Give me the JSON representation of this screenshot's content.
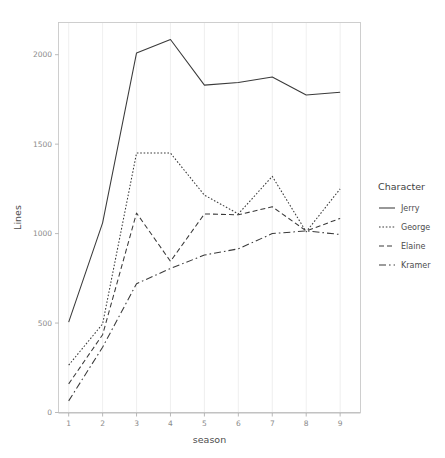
{
  "chart_data": {
    "type": "line",
    "title": "",
    "xlabel": "season",
    "ylabel": "Lines",
    "x": [
      1,
      2,
      3,
      4,
      5,
      6,
      7,
      8,
      9
    ],
    "categories": [
      "1",
      "2",
      "3",
      "4",
      "5",
      "6",
      "7",
      "8",
      "9"
    ],
    "xlim": [
      0.7,
      9.6
    ],
    "ylim": [
      0,
      2180
    ],
    "y_ticks": [
      0,
      500,
      1000,
      1500,
      2000
    ],
    "y_tick_labels": [
      "0",
      "500",
      "1000",
      "1500",
      "2000"
    ],
    "x_ticks": [
      1,
      2,
      3,
      4,
      5,
      6,
      7,
      8,
      9
    ],
    "x_tick_labels": [
      "1",
      "2",
      "3",
      "4",
      "5",
      "6",
      "7",
      "8",
      "9"
    ],
    "grid": "vertical-major-only",
    "legend_position": "right",
    "legend_title": "Character",
    "series": [
      {
        "name": "Jerry",
        "linestyle": "solid",
        "dash_pattern": "none",
        "color": "#3a3a3a",
        "values": [
          505,
          1060,
          2010,
          2085,
          1830,
          1845,
          1875,
          1775,
          1790
        ]
      },
      {
        "name": "George",
        "linestyle": "dotted",
        "dash_pattern": "1.6,1.8",
        "color": "#3a3a3a",
        "values": [
          265,
          495,
          1450,
          1450,
          1215,
          1110,
          1320,
          1010,
          1250
        ]
      },
      {
        "name": "Elaine",
        "linestyle": "dashed",
        "dash_pattern": "5,3",
        "color": "#3a3a3a",
        "values": [
          160,
          435,
          1115,
          845,
          1110,
          1105,
          1150,
          1015,
          1085
        ]
      },
      {
        "name": "Kramer",
        "linestyle": "dashdot",
        "dash_pattern": "7,3,1.6,3",
        "color": "#3a3a3a",
        "values": [
          65,
          365,
          720,
          805,
          880,
          915,
          1000,
          1015,
          995
        ]
      }
    ]
  },
  "axes": {
    "y_label": "Lines",
    "x_label": "season"
  },
  "legend": {
    "title": "Character",
    "entries": [
      {
        "label": "Jerry"
      },
      {
        "label": "George"
      },
      {
        "label": "Elaine"
      },
      {
        "label": "Kramer"
      }
    ]
  }
}
